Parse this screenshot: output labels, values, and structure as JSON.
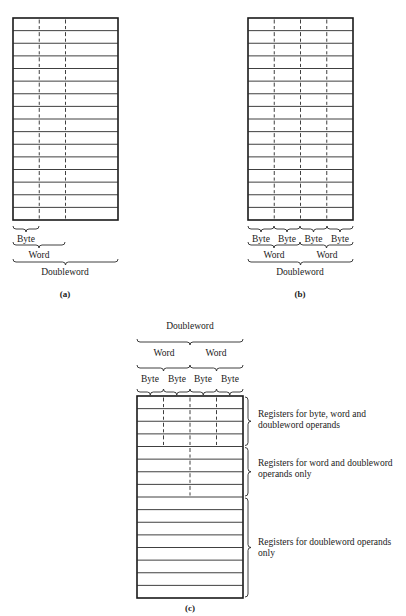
{
  "diagram_a": {
    "caption": "(a)",
    "rows": 16,
    "labels": {
      "byte": "Byte",
      "word": "Word",
      "doubleword": "Doubleword"
    }
  },
  "diagram_b": {
    "caption": "(b)",
    "rows": 16,
    "labels": {
      "bytes": [
        "Byte",
        "Byte",
        "Byte",
        "Byte"
      ],
      "words": [
        "Word",
        "Word"
      ],
      "doubleword": "Doubleword"
    }
  },
  "diagram_c": {
    "caption": "(c)",
    "rows": 16,
    "labels": {
      "doubleword": "Doubleword",
      "words": [
        "Word",
        "Word"
      ],
      "bytes": [
        "Byte",
        "Byte",
        "Byte",
        "Byte"
      ]
    },
    "groups": [
      {
        "rows": 4,
        "line1": "Registers for byte, word and",
        "line2": "doubleword operands"
      },
      {
        "rows": 4,
        "line1": "Registers for word and doubleword",
        "line2": "operands only"
      },
      {
        "rows": 8,
        "line1": "Registers for doubleword operands",
        "line2": "only"
      }
    ]
  }
}
